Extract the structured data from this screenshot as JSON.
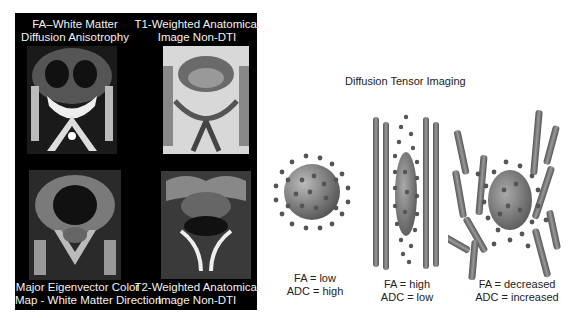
{
  "left_panel": {
    "images": [
      {
        "id": "fa",
        "caption_line1": "FA–White Matter",
        "caption_line2": "Diffusion Anisotrophy"
      },
      {
        "id": "t1",
        "caption_line1": "T1-Weighted Anatomical",
        "caption_line2": "Image Non-DTI"
      },
      {
        "id": "eigen",
        "caption_line1": "Major Eigenvector Color",
        "caption_line2": "Map - White Matter Direction"
      },
      {
        "id": "t2",
        "caption_line1": "T2-Weighted Anatomical",
        "caption_line2": "Image Non-DTI"
      }
    ]
  },
  "diagram": {
    "title": "Diffusion Tensor Imaging",
    "cases": [
      {
        "fa": "FA = low",
        "adc": "ADC = high",
        "shape": "sphere"
      },
      {
        "fa": "FA = high",
        "adc": "ADC = low",
        "shape": "elongated-ellipsoid-between-fibers"
      },
      {
        "fa": "FA = decreased",
        "adc": "ADC = increased",
        "shape": "ellipsoid-disrupted-fibers"
      }
    ]
  },
  "colors": {
    "panel_bg": "#000000",
    "fiber": "#6e6e6e",
    "dot": "#4a4a4a",
    "sphere": "#8a8a8a"
  }
}
